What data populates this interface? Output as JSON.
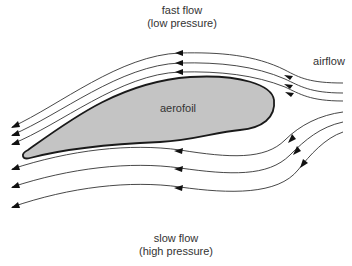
{
  "diagram": {
    "labels": {
      "top_line1": "fast flow",
      "top_line2": "(low pressure)",
      "bottom_line1": "slow flow",
      "bottom_line2": "(high pressure)",
      "airflow": "airflow",
      "aerofoil": "aerofoil"
    },
    "upper_streamlines": 3,
    "lower_streamlines": 3,
    "flow_direction": "right-to-left",
    "colors": {
      "aerofoil_fill": "#c4c4c4",
      "outline": "#1a1a1a",
      "streamline": "#333333",
      "text": "#333333",
      "background": "#ffffff"
    }
  }
}
